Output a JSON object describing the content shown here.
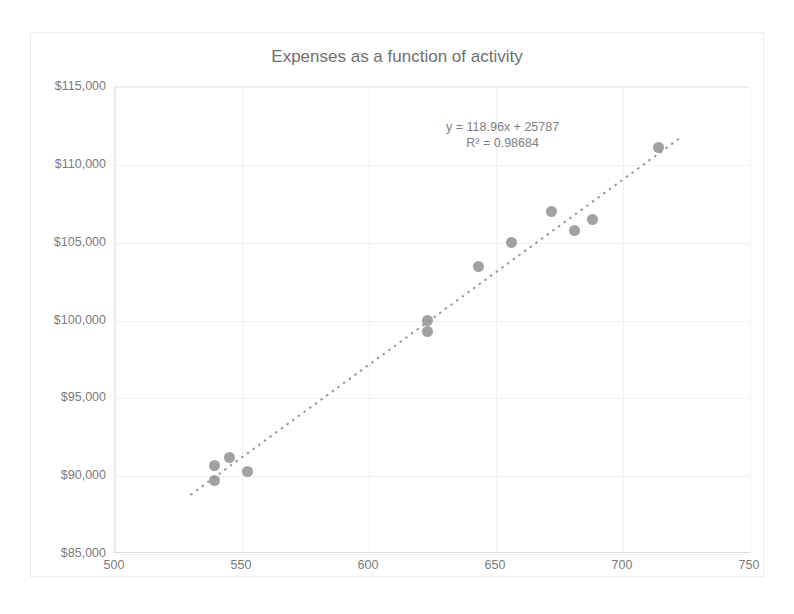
{
  "page": {
    "top_cutoff_text": ""
  },
  "chart": {
    "title": "Expenses as a function of activity",
    "marker_color": "#8c8c8c",
    "trendline_color": "#9a9a9a",
    "grid_color": "#f1f1f1",
    "axis_color": "#dcdcdc",
    "text_color": "#7b7b7b"
  },
  "chart_data": {
    "type": "scatter",
    "title": "Expenses as a function of activity",
    "xlabel": "",
    "ylabel": "",
    "xlim": [
      500,
      750
    ],
    "ylim": [
      85000,
      115000
    ],
    "xticks": [
      500,
      550,
      600,
      650,
      700,
      750
    ],
    "xtick_labels": [
      "500",
      "550",
      "600",
      "650",
      "700",
      "750"
    ],
    "yticks": [
      85000,
      90000,
      95000,
      100000,
      105000,
      110000,
      115000
    ],
    "ytick_labels": [
      "$85,000",
      "$90,000",
      "$95,000",
      "$100,000",
      "$105,000",
      "$110,000",
      "$115,000"
    ],
    "grid": true,
    "legend": null,
    "points": [
      {
        "x": 539,
        "y": 90700
      },
      {
        "x": 539,
        "y": 89700
      },
      {
        "x": 545,
        "y": 91200
      },
      {
        "x": 552,
        "y": 90300
      },
      {
        "x": 623,
        "y": 100000
      },
      {
        "x": 623,
        "y": 99300
      },
      {
        "x": 643,
        "y": 103500
      },
      {
        "x": 656,
        "y": 105000
      },
      {
        "x": 672,
        "y": 107000
      },
      {
        "x": 681,
        "y": 105800
      },
      {
        "x": 688,
        "y": 106500
      },
      {
        "x": 714,
        "y": 111100
      }
    ],
    "trendline": {
      "style": "dotted",
      "slope": 118.96,
      "intercept": 25787,
      "r_squared": 0.98684,
      "equation_label": "y = 118.96x + 25787",
      "r2_label": "R² = 0.98684"
    },
    "annotations": [
      {
        "text": "y = 118.96x + 25787",
        "x": 665,
        "y": 112400
      },
      {
        "text": "R² = 0.98684",
        "x": 665,
        "y": 111600
      }
    ]
  }
}
